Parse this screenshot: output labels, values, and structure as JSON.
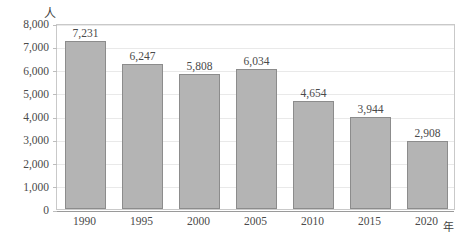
{
  "chart_data": {
    "type": "bar",
    "title": "",
    "xlabel": "年",
    "ylabel": "人",
    "categories": [
      "1990",
      "1995",
      "2000",
      "2005",
      "2010",
      "2015",
      "2020"
    ],
    "values": [
      7231,
      6247,
      5808,
      6034,
      4654,
      3944,
      2908
    ],
    "value_labels": [
      "7,231",
      "6,247",
      "5,808",
      "6,034",
      "4,654",
      "3,944",
      "2,908"
    ],
    "ylim": [
      0,
      8000
    ],
    "ytick_values": [
      0,
      1000,
      2000,
      3000,
      4000,
      5000,
      6000,
      7000,
      8000
    ],
    "ytick_labels": [
      "0",
      "1,000",
      "2,000",
      "3,000",
      "4,000",
      "5,000",
      "6,000",
      "7,000",
      "8,000"
    ],
    "grid": true,
    "legend": false,
    "series": [
      {
        "name": "",
        "values": [
          7231,
          6247,
          5808,
          6034,
          4654,
          3944,
          2908
        ]
      }
    ],
    "colors": {
      "bar_fill": "#b4b4b4",
      "bar_border": "#8c8c8c",
      "gridline": "#e9e9e9",
      "axis": "#9a9a9a",
      "frame": "#c9c9c9",
      "text": "#4a4a4a",
      "background": "#ffffff"
    }
  }
}
